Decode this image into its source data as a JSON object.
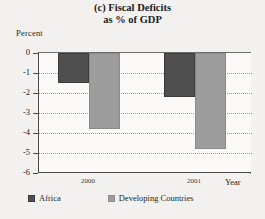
{
  "chart_data": {
    "type": "bar",
    "title": "(c) Fiscal Deficits as % of GDP",
    "title_line1": "(c) Fiscal Deficits",
    "title_line2": "as % of GDP",
    "categories": [
      "2000",
      "2001"
    ],
    "series": [
      {
        "name": "Africa",
        "values": [
          -1.5,
          -2.2
        ],
        "color": "#4f4f4f"
      },
      {
        "name": "Developing Countries",
        "values": [
          -3.8,
          -4.8
        ],
        "color": "#9d9d9d"
      }
    ],
    "xlabel": "Year",
    "ylabel": "Percent",
    "ylim": [
      -6,
      0
    ],
    "ytick_labels": [
      "0",
      "-1",
      "-2",
      "-3",
      "-4",
      "-5",
      "-6"
    ],
    "ytick_values": [
      0,
      -1,
      -2,
      -3,
      -4,
      -5,
      -6
    ],
    "grid": true,
    "legend_position": "bottom"
  },
  "legend": {
    "entries": [
      {
        "label": "Africa"
      },
      {
        "label": "Developing Countries"
      }
    ]
  }
}
